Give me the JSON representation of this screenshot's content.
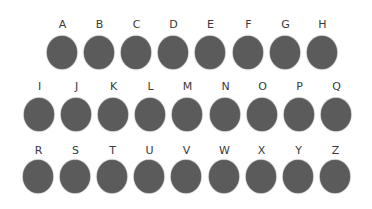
{
  "rows": [
    {
      "letters": [
        "A",
        "B",
        "C",
        "D",
        "E",
        "F",
        "G",
        "H"
      ],
      "x0": 47,
      "label_y": 19,
      "dot_y": 36
    },
    {
      "letters": [
        "I",
        "J",
        "K",
        "L",
        "M",
        "N",
        "O",
        "P",
        "Q"
      ],
      "x0": 24,
      "label_y": 81,
      "dot_y": 98
    },
    {
      "letters": [
        "R",
        "S",
        "T",
        "U",
        "V",
        "W",
        "X",
        "Y",
        "Z"
      ],
      "x0": 23,
      "label_y": 145,
      "dot_y": 160
    }
  ],
  "pitch": 37.1,
  "colors": {
    "dot": "#5b5b5b",
    "label": "#3a3a3a",
    "background": "#ffffff"
  }
}
